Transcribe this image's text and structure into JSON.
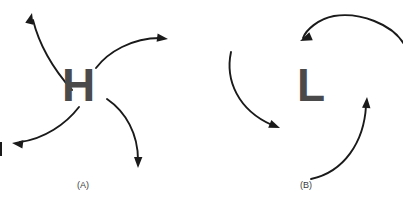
{
  "figure": {
    "width": 403,
    "height": 203,
    "background_color": "#ffffff",
    "arrow_color": "#1a1a1a",
    "symbol_color": "#4a4a4a"
  },
  "panels": [
    {
      "id": "panel-a",
      "label": "(A)",
      "symbol": "H",
      "symbol_name": "high-pressure-center",
      "circulation": "clockwise-outflow",
      "arrow_count": 4
    },
    {
      "id": "panel-b",
      "label": "(B)",
      "symbol": "L",
      "symbol_name": "low-pressure-center",
      "circulation": "counterclockwise-inflow",
      "arrow_count": 3
    }
  ],
  "arrows": {
    "panel_a": [
      {
        "name": "arrow-high-upper-left",
        "path": "M 72 90 C 56 72 40 48 33 20",
        "head_x": 32,
        "head_y": 13,
        "head_angle": -76
      },
      {
        "name": "arrow-high-upper-right",
        "path": "M 96 68 C 108 52 132 38 160 38",
        "head_x": 168,
        "head_y": 39,
        "head_angle": 7
      },
      {
        "name": "arrow-high-lower-left",
        "path": "M 79 107 C 66 124 44 139 20 142",
        "head_x": 12,
        "head_y": 143,
        "head_angle": 187
      },
      {
        "name": "arrow-high-lower-right",
        "path": "M 107 99 C 126 112 138 134 138 160",
        "head_x": 138,
        "head_y": 168,
        "head_angle": 91
      }
    ],
    "panel_b": [
      {
        "name": "arrow-low-top-arc",
        "path": "M 404 44 C 392 24 360 12 334 16 C 318 19 306 30 303 38",
        "head_x": 300,
        "head_y": 41,
        "head_angle": 157
      },
      {
        "name": "arrow-low-left",
        "path": "M 231 52 C 225 80 238 110 272 125",
        "head_x": 280,
        "head_y": 128,
        "head_angle": 22
      },
      {
        "name": "arrow-low-bottom-right",
        "path": "M 311 179 C 344 172 364 142 366 106",
        "head_x": 367,
        "head_y": 97,
        "head_angle": -86
      }
    ]
  },
  "edge_marker": {
    "name": "left-edge-clipped-tick",
    "x": 0,
    "y": 142
  }
}
